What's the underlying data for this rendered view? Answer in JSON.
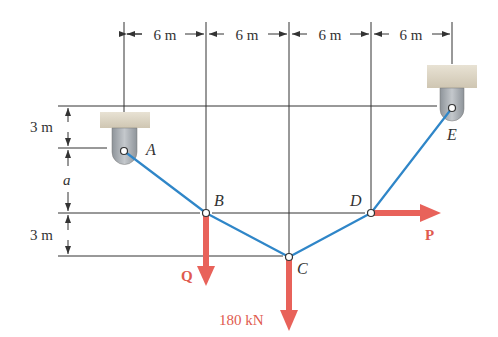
{
  "dimensions": {
    "horizontal": [
      "6 m",
      "6 m",
      "6 m",
      "6 m"
    ],
    "vertical": {
      "top": "3 m",
      "middle": "a",
      "bottom": "3 m"
    }
  },
  "points": {
    "A": "A",
    "B": "B",
    "C": "C",
    "D": "D",
    "E": "E"
  },
  "forces": {
    "Q": "Q",
    "C_load": "180 kN",
    "P": "P"
  },
  "colors": {
    "cable": "#2f86c8",
    "force": "#e8625a",
    "line": "#333333",
    "support_block": "#d9d1c0",
    "support_clevis": "#a8adb3"
  }
}
